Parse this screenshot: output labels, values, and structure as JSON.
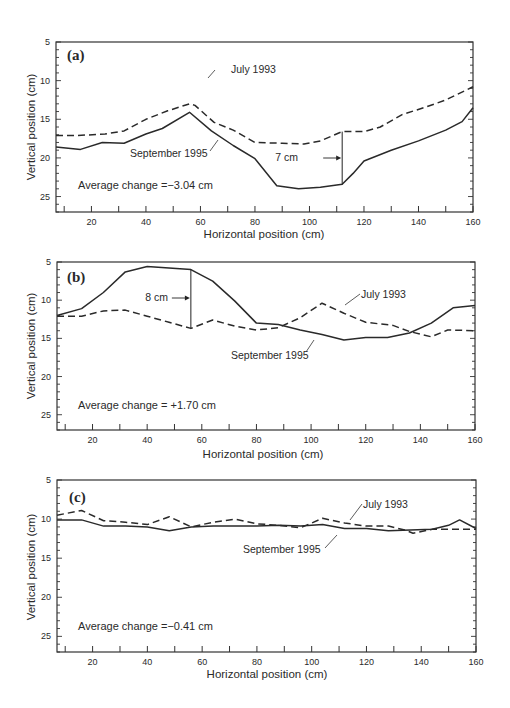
{
  "figure": {
    "panels": [
      {
        "id": "a",
        "label": "(a)",
        "average_change": "Average change =−3.04 cm",
        "difference_label": "7 cm"
      },
      {
        "id": "b",
        "label": "(b)",
        "average_change": "Average change = +1.70 cm",
        "difference_label": "8 cm"
      },
      {
        "id": "c",
        "label": "(c)",
        "average_change": "Average change =−0.41 cm",
        "difference_label": ""
      }
    ],
    "xlabel": "Horizontal position (cm)",
    "ylabel": "Vertical position (cm)",
    "series_names": [
      "July 1993",
      "September 1995"
    ]
  },
  "chart_data": [
    {
      "type": "line",
      "panel": "(a)",
      "title": "",
      "xlabel": "Horizontal position (cm)",
      "ylabel": "Vertical position (cm)",
      "xlim": [
        7,
        160
      ],
      "ylim": [
        27,
        5
      ],
      "y_inverted": true,
      "xticks": [
        20,
        40,
        60,
        80,
        100,
        120,
        140,
        160
      ],
      "yticks": [
        5,
        10,
        15,
        20,
        25
      ],
      "grid": false,
      "legend": "inline annotations",
      "annotations": [
        "Average change =−3.04 cm",
        "7 cm (at x≈112)"
      ],
      "series": [
        {
          "name": "July 1993",
          "style": "dashed",
          "x": [
            7,
            15,
            25,
            32,
            40,
            48,
            56,
            58,
            65,
            72,
            80,
            90,
            98,
            104,
            112,
            120,
            126,
            134,
            142,
            150,
            160
          ],
          "y": [
            17.1,
            17.1,
            16.9,
            16.5,
            15.0,
            13.9,
            13.0,
            13.2,
            15.4,
            16.4,
            18.0,
            18.1,
            18.2,
            17.8,
            16.6,
            16.6,
            16.0,
            14.4,
            13.5,
            12.5,
            10.8
          ]
        },
        {
          "name": "September 1995",
          "style": "solid",
          "x": [
            7,
            16,
            24,
            32,
            40,
            46,
            56,
            64,
            72,
            80,
            88,
            96,
            104,
            112,
            116,
            120,
            130,
            140,
            150,
            156,
            160
          ],
          "y": [
            18.6,
            18.9,
            18.0,
            18.1,
            16.9,
            16.2,
            14.1,
            16.5,
            18.4,
            20.1,
            23.6,
            24.0,
            23.8,
            23.4,
            22.0,
            20.4,
            19.0,
            17.8,
            16.4,
            15.3,
            13.5
          ]
        }
      ]
    },
    {
      "type": "line",
      "panel": "(b)",
      "title": "",
      "xlabel": "Horizontal position (cm)",
      "ylabel": "Vertical position (cm)",
      "xlim": [
        7,
        160
      ],
      "ylim": [
        27,
        5
      ],
      "y_inverted": true,
      "xticks": [
        20,
        40,
        60,
        80,
        100,
        120,
        140,
        160
      ],
      "yticks": [
        5,
        10,
        15,
        20,
        25
      ],
      "grid": false,
      "legend": "inline annotations",
      "annotations": [
        "Average change = +1.70 cm",
        "8 cm (at x≈56)"
      ],
      "series": [
        {
          "name": "July 1993",
          "style": "dashed",
          "x": [
            7,
            16,
            24,
            32,
            40,
            48,
            56,
            64,
            72,
            80,
            88,
            96,
            104,
            112,
            120,
            130,
            136,
            144,
            150,
            160
          ],
          "y": [
            12.1,
            12.1,
            11.4,
            11.3,
            12.1,
            12.9,
            13.7,
            12.6,
            13.4,
            13.9,
            13.6,
            12.3,
            10.4,
            11.7,
            12.9,
            13.3,
            14.1,
            14.8,
            13.9,
            14.0
          ]
        },
        {
          "name": "September 1995",
          "style": "solid",
          "x": [
            7,
            16,
            24,
            32,
            40,
            48,
            56,
            64,
            72,
            80,
            88,
            96,
            104,
            112,
            120,
            128,
            136,
            144,
            152,
            160
          ],
          "y": [
            12.0,
            11.1,
            9.0,
            6.3,
            5.6,
            5.8,
            6.0,
            7.5,
            10.1,
            13.0,
            13.2,
            13.9,
            14.5,
            15.2,
            14.9,
            14.9,
            14.3,
            13.0,
            11.0,
            10.7
          ]
        }
      ]
    },
    {
      "type": "line",
      "panel": "(c)",
      "title": "",
      "xlabel": "Horizontal position (cm)",
      "ylabel": "Vertical position (cm)",
      "xlim": [
        7,
        160
      ],
      "ylim": [
        27,
        5
      ],
      "y_inverted": true,
      "xticks": [
        20,
        40,
        60,
        80,
        100,
        120,
        140,
        160
      ],
      "yticks": [
        5,
        10,
        15,
        20,
        25
      ],
      "grid": false,
      "legend": "inline annotations",
      "annotations": [
        "Average change =−0.41 cm"
      ],
      "series": [
        {
          "name": "July 1993",
          "style": "dashed",
          "x": [
            7,
            16,
            24,
            32,
            40,
            48,
            56,
            64,
            72,
            80,
            88,
            96,
            104,
            112,
            120,
            128,
            134,
            137,
            144,
            152,
            160
          ],
          "y": [
            9.5,
            8.9,
            10.2,
            10.4,
            10.7,
            9.7,
            11.0,
            10.4,
            10.0,
            10.6,
            10.8,
            11.1,
            9.9,
            10.5,
            10.9,
            10.9,
            11.4,
            11.8,
            11.3,
            11.3,
            11.3
          ]
        },
        {
          "name": "September 1995",
          "style": "solid",
          "x": [
            7,
            16,
            24,
            32,
            40,
            48,
            56,
            64,
            72,
            80,
            88,
            96,
            104,
            112,
            120,
            128,
            136,
            144,
            150,
            154,
            160
          ],
          "y": [
            10.1,
            10.1,
            10.9,
            10.9,
            11.0,
            11.5,
            11.0,
            10.9,
            10.9,
            10.9,
            10.8,
            10.9,
            10.7,
            11.2,
            11.2,
            11.5,
            11.4,
            11.3,
            10.8,
            10.1,
            11.2
          ]
        }
      ]
    }
  ]
}
